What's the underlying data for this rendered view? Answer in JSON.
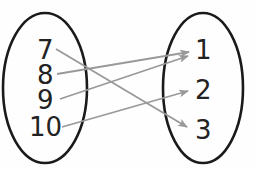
{
  "diagram": {
    "type": "mapping-diagram",
    "domain": {
      "label": "domain-set",
      "items": [
        "7",
        "8",
        "9",
        "10"
      ]
    },
    "range": {
      "label": "range-set",
      "items": [
        "1",
        "2",
        "3"
      ]
    },
    "mappings": [
      {
        "from": "7",
        "to": "3"
      },
      {
        "from": "8",
        "to": "1"
      },
      {
        "from": "9",
        "to": "1"
      },
      {
        "from": "10",
        "to": "2"
      }
    ],
    "colors": {
      "oval_stroke": "#1a1a1a",
      "arrow": "#999999",
      "text": "#222222",
      "background": "#fefefe"
    }
  }
}
